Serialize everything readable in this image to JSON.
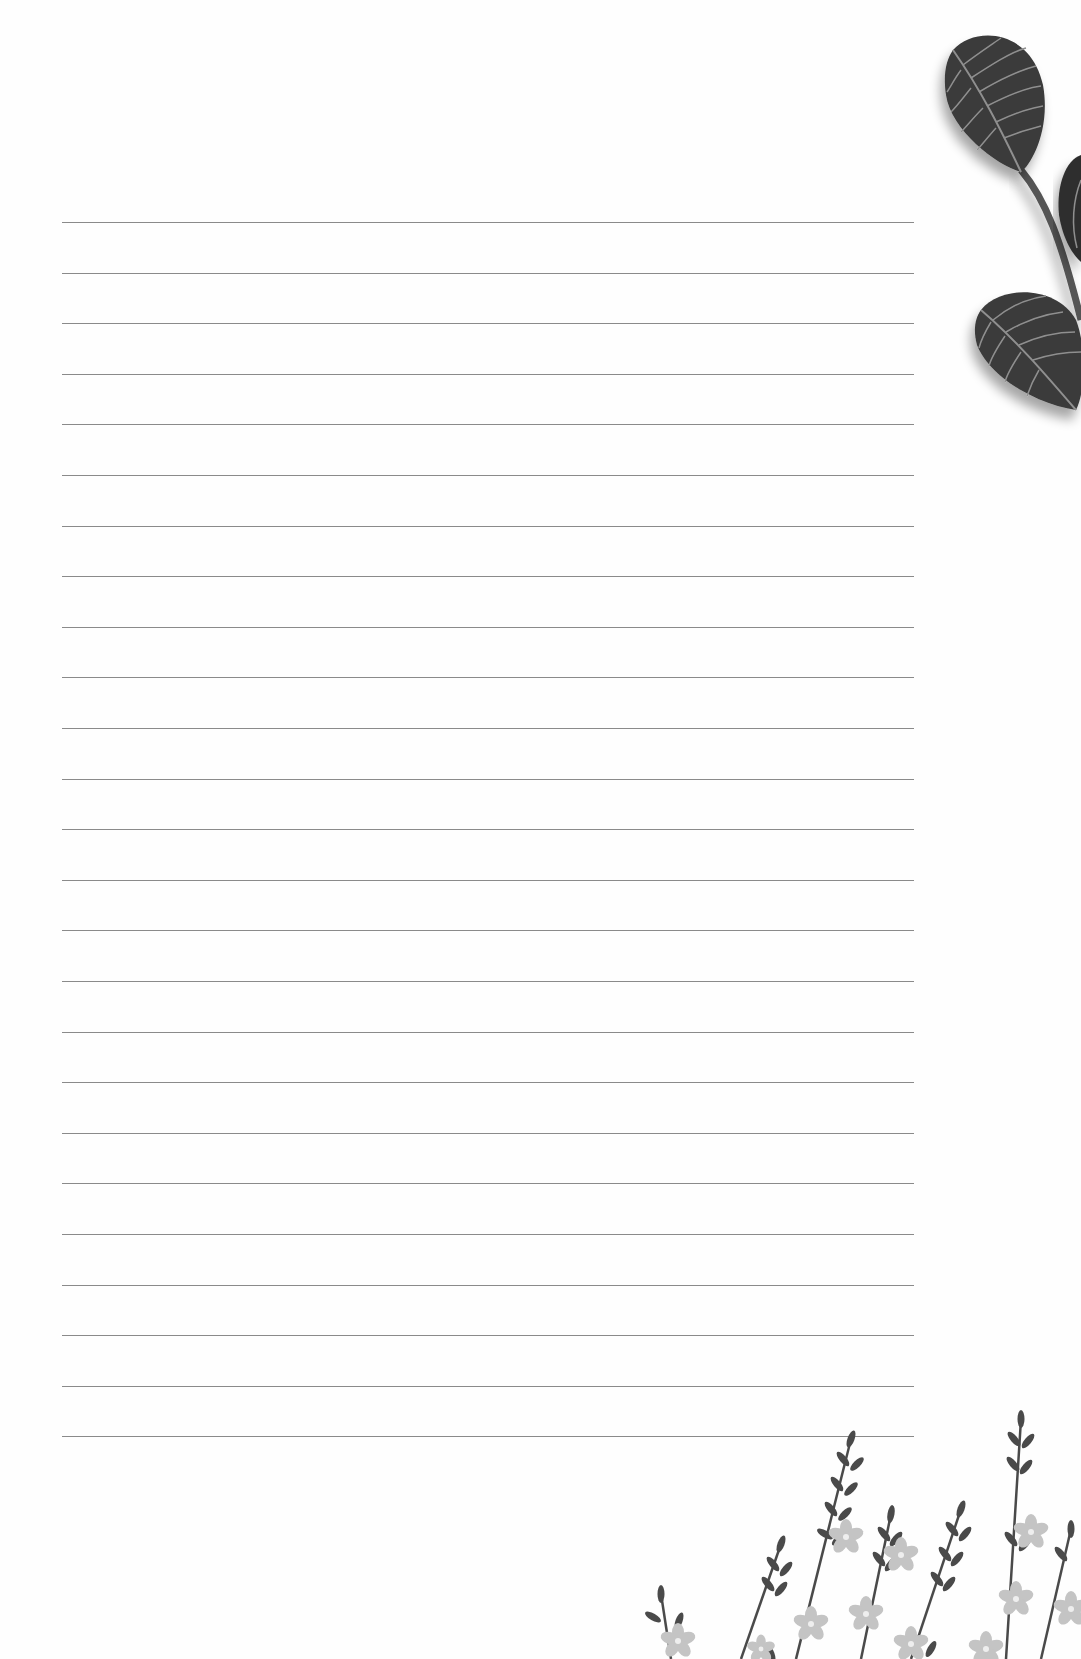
{
  "page": {
    "type": "ruled-notepaper",
    "background_color": "#ffffff",
    "line_color": "#8a8a8a",
    "line_count": 25,
    "first_line_y": 222,
    "line_spacing": 50.6,
    "line_left": 62,
    "line_right": 914
  },
  "decorations": {
    "top_right": "leaf-sprig-illustration",
    "bottom_right": "wildflower-border-illustration",
    "leaf_color_dark": "#2e2e2e",
    "leaf_color_mid": "#5a5a5a",
    "flower_color": "#c4c4c4",
    "stem_color": "#4a4a4a"
  }
}
